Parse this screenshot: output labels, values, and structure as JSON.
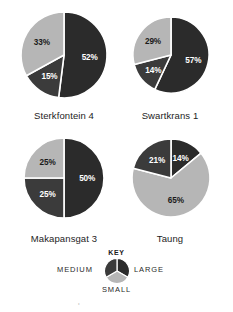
{
  "figure": {
    "title": "",
    "key": {
      "heading": "KEY",
      "labels": {
        "medium": "MEDIUM",
        "large": "LARGE",
        "small": "SMALL"
      },
      "key_pie": {
        "segments": [
          {
            "name": "LARGE",
            "share": 33.3333,
            "color": "#2b2b2b"
          },
          {
            "name": "SMALL",
            "share": 33.3333,
            "color": "#b6b6b6"
          },
          {
            "name": "MEDIUM",
            "share": 33.3333,
            "color": "#3b3b3b"
          }
        ]
      }
    },
    "bottom_caption": "the overall pattern of the size distribution"
  },
  "colors": {
    "large": "#2b2b2b",
    "medium": "#3b3b3b",
    "small": "#b6b6b6",
    "slice_divider": "#ffffff",
    "label_on_dark": "#ffffff",
    "label_on_light": "#1a1a1a",
    "background": "#ffffff"
  },
  "chart_data": [
    {
      "type": "pie",
      "title": "Sterkfontein 4",
      "categories": [
        "LARGE",
        "MEDIUM",
        "SMALL"
      ],
      "values": [
        52,
        15,
        33
      ],
      "labels": [
        "52%",
        "15%",
        "33%"
      ],
      "xlabel": "",
      "ylabel": "",
      "legend": "KEY",
      "start_angle_deg": 0,
      "direction": "clockwise",
      "slices": [
        {
          "name": "LARGE",
          "value": 52,
          "label": "52%",
          "color": "#2b2b2b",
          "label_color": "#ffffff"
        },
        {
          "name": "MEDIUM",
          "value": 15,
          "label": "15%",
          "color": "#3b3b3b",
          "label_color": "#ffffff"
        },
        {
          "name": "SMALL",
          "value": 33,
          "label": "33%",
          "color": "#b6b6b6",
          "label_color": "#1a1a1a"
        }
      ]
    },
    {
      "type": "pie",
      "title": "Swartkrans 1",
      "categories": [
        "LARGE",
        "MEDIUM",
        "SMALL"
      ],
      "values": [
        57,
        14,
        29
      ],
      "labels": [
        "57%",
        "14%",
        "29%"
      ],
      "xlabel": "",
      "ylabel": "",
      "legend": "KEY",
      "start_angle_deg": 0,
      "direction": "clockwise",
      "slices": [
        {
          "name": "LARGE",
          "value": 57,
          "label": "57%",
          "color": "#2b2b2b",
          "label_color": "#ffffff"
        },
        {
          "name": "MEDIUM",
          "value": 14,
          "label": "14%",
          "color": "#3b3b3b",
          "label_color": "#ffffff"
        },
        {
          "name": "SMALL",
          "value": 29,
          "label": "29%",
          "color": "#b6b6b6",
          "label_color": "#1a1a1a"
        }
      ]
    },
    {
      "type": "pie",
      "title": "Makapansgat 3",
      "categories": [
        "LARGE",
        "MEDIUM",
        "SMALL"
      ],
      "values": [
        50,
        25,
        25
      ],
      "labels": [
        "50%",
        "25%",
        "25%"
      ],
      "xlabel": "",
      "ylabel": "",
      "legend": "KEY",
      "start_angle_deg": 0,
      "direction": "clockwise",
      "slices": [
        {
          "name": "LARGE",
          "value": 50,
          "label": "50%",
          "color": "#2b2b2b",
          "label_color": "#ffffff"
        },
        {
          "name": "MEDIUM",
          "value": 25,
          "label": "25%",
          "color": "#3b3b3b",
          "label_color": "#ffffff"
        },
        {
          "name": "SMALL",
          "value": 25,
          "label": "25%",
          "color": "#b6b6b6",
          "label_color": "#1a1a1a"
        }
      ]
    },
    {
      "type": "pie",
      "title": "Taung",
      "categories": [
        "LARGE",
        "MEDIUM",
        "SMALL"
      ],
      "values": [
        14,
        21,
        65
      ],
      "labels": [
        "14%",
        "21%",
        "65%"
      ],
      "xlabel": "",
      "ylabel": "",
      "legend": "KEY",
      "start_angle_deg": 0,
      "direction": "clockwise",
      "slices": [
        {
          "name": "LARGE",
          "value": 14,
          "label": "14%",
          "color": "#2b2b2b",
          "label_color": "#ffffff"
        },
        {
          "name": "SMALL",
          "value": 65,
          "label": "65%",
          "color": "#b6b6b6",
          "label_color": "#1a1a1a"
        },
        {
          "name": "MEDIUM",
          "value": 21,
          "label": "21%",
          "color": "#3b3b3b",
          "label_color": "#ffffff"
        }
      ]
    }
  ],
  "layout": {
    "panels": [
      {
        "cx": 64,
        "cy": 60,
        "r": 43,
        "label_top": 110
      },
      {
        "cx": 171,
        "cy": 60,
        "r": 39,
        "label_top": 110
      },
      {
        "cx": 64,
        "cy": 188,
        "r": 40,
        "label_top": 233
      },
      {
        "cx": 171,
        "cy": 188,
        "r": 39,
        "label_top": 233
      }
    ]
  }
}
